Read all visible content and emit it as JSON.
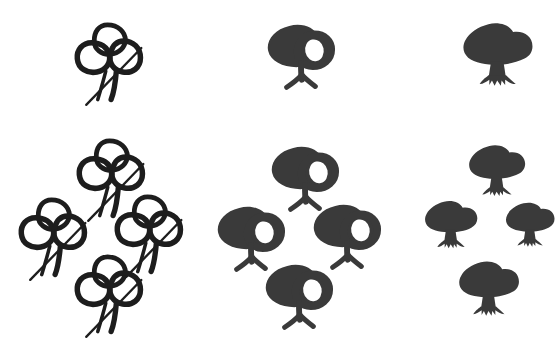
{
  "figure": {
    "width": 559,
    "height": 364,
    "background_color": "#ffffff",
    "ink_color": "#3a3a3a",
    "outline_color": "#1d1d1d"
  },
  "columns": [
    {
      "id": "outlined-slashed",
      "name": "outlined-tree-with-slash",
      "style": "outline",
      "has_slash": true,
      "single_count": 1,
      "group_count": 4
    },
    {
      "id": "filled-gap",
      "name": "filled-tree-with-canopy-gap",
      "style": "filled-gap",
      "has_slash": false,
      "single_count": 1,
      "group_count": 4
    },
    {
      "id": "solid",
      "name": "solid-filled-tree",
      "style": "solid",
      "has_slash": false,
      "single_count": 1,
      "group_count": 4
    }
  ],
  "symbols": [
    {
      "name": "outlined-tree-single",
      "column": "outlined-slashed",
      "row": "top",
      "x": 72,
      "y": 18,
      "w": 80,
      "h": 92
    },
    {
      "name": "filled-gap-tree-single",
      "column": "filled-gap",
      "row": "top",
      "x": 264,
      "y": 18,
      "w": 74,
      "h": 78
    },
    {
      "name": "solid-tree-single",
      "column": "solid",
      "row": "top",
      "x": 462,
      "y": 20,
      "w": 74,
      "h": 70
    },
    {
      "name": "outlined-tree-group-top",
      "column": "outlined-slashed",
      "row": "bottom",
      "x": 74,
      "y": 134,
      "w": 80,
      "h": 92
    },
    {
      "name": "outlined-tree-group-left",
      "column": "outlined-slashed",
      "row": "bottom",
      "x": 16,
      "y": 193,
      "w": 80,
      "h": 92
    },
    {
      "name": "outlined-tree-group-right",
      "column": "outlined-slashed",
      "row": "bottom",
      "x": 112,
      "y": 190,
      "w": 80,
      "h": 92
    },
    {
      "name": "outlined-tree-group-bottom",
      "column": "outlined-slashed",
      "row": "bottom",
      "x": 72,
      "y": 250,
      "w": 80,
      "h": 92
    },
    {
      "name": "filled-gap-tree-group-top",
      "column": "filled-gap",
      "row": "bottom",
      "x": 268,
      "y": 140,
      "w": 74,
      "h": 78
    },
    {
      "name": "filled-gap-tree-group-left",
      "column": "filled-gap",
      "row": "bottom",
      "x": 214,
      "y": 200,
      "w": 74,
      "h": 78
    },
    {
      "name": "filled-gap-tree-group-right",
      "column": "filled-gap",
      "row": "bottom",
      "x": 310,
      "y": 198,
      "w": 74,
      "h": 78
    },
    {
      "name": "filled-gap-tree-group-bottom",
      "column": "filled-gap",
      "row": "bottom",
      "x": 262,
      "y": 258,
      "w": 74,
      "h": 78
    },
    {
      "name": "solid-tree-group-top",
      "column": "solid",
      "row": "bottom",
      "x": 468,
      "y": 142,
      "w": 60,
      "h": 58
    },
    {
      "name": "solid-tree-group-left",
      "column": "solid",
      "row": "bottom",
      "x": 424,
      "y": 198,
      "w": 56,
      "h": 54
    },
    {
      "name": "solid-tree-group-right",
      "column": "solid",
      "row": "bottom",
      "x": 505,
      "y": 200,
      "w": 52,
      "h": 50
    },
    {
      "name": "solid-tree-group-bottom",
      "column": "solid",
      "row": "bottom",
      "x": 458,
      "y": 258,
      "w": 64,
      "h": 62
    }
  ]
}
